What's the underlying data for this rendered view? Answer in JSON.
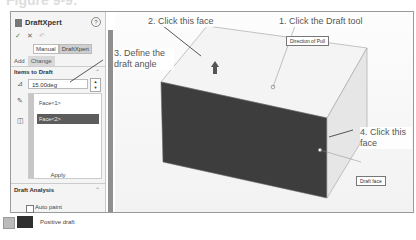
{
  "figure": {
    "title": "Figure 9-9:"
  },
  "panel": {
    "title": "DraftXpert",
    "help": "?",
    "actions": [
      "✓",
      "✕",
      "↶"
    ],
    "modes": [
      "Manual",
      "DraftXpert"
    ],
    "active_mode": "DraftXpert",
    "tabs": [
      "Add",
      "Change"
    ],
    "active_tab": "Change",
    "items_section": {
      "header": "Items to Draft",
      "angle_value": "15.00deg",
      "faces": [
        "Face<1>",
        "Face<2>"
      ],
      "selected_face": "Face<2>",
      "apply_label": "Apply"
    },
    "analysis_section": {
      "header": "Draft Analysis",
      "auto_paint_label": "Auto paint",
      "auto_paint_checked": false,
      "positive_draft_label": "Positive draft"
    }
  },
  "callouts": {
    "step1": "1. Click the Draft tool",
    "step2": "2. Click this face",
    "step3": "3. Define the draft angle",
    "step4": "4. Click this face"
  },
  "tags": {
    "direction_of_pull": "Direction of Pull",
    "draft_face": "Draft face"
  },
  "colors": {
    "dark_face": "#3a3a3a",
    "top_face": "#f2f2f2",
    "side_face": "#e4e4e4",
    "selected_item": "#5c5c5c"
  }
}
